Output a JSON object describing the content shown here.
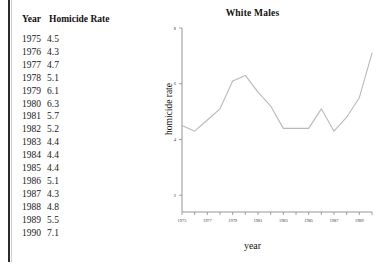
{
  "table": {
    "headers": [
      "Year",
      "Homicide Rate"
    ],
    "rows": [
      {
        "year": "1975",
        "rate": "4.5"
      },
      {
        "year": "1976",
        "rate": "4.3"
      },
      {
        "year": "1977",
        "rate": "4.7"
      },
      {
        "year": "1978",
        "rate": "5.1"
      },
      {
        "year": "1979",
        "rate": "6.1"
      },
      {
        "year": "1980",
        "rate": "6.3"
      },
      {
        "year": "1981",
        "rate": "5.7"
      },
      {
        "year": "1982",
        "rate": "5.2"
      },
      {
        "year": "1983",
        "rate": "4.4"
      },
      {
        "year": "1984",
        "rate": "4.4"
      },
      {
        "year": "1985",
        "rate": "4.4"
      },
      {
        "year": "1986",
        "rate": "5.1"
      },
      {
        "year": "1987",
        "rate": "4.3"
      },
      {
        "year": "1988",
        "rate": "4.8"
      },
      {
        "year": "1989",
        "rate": "5.5"
      },
      {
        "year": "1990",
        "rate": "7.1"
      }
    ]
  },
  "chart_data": {
    "type": "line",
    "title": "White Males",
    "xlabel": "year",
    "ylabel": "homicide rate",
    "x": [
      1975,
      1976,
      1977,
      1978,
      1979,
      1980,
      1981,
      1982,
      1983,
      1984,
      1985,
      1986,
      1987,
      1988,
      1989,
      1990
    ],
    "values": [
      4.5,
      4.3,
      4.7,
      5.1,
      6.1,
      6.3,
      5.7,
      5.2,
      4.4,
      4.4,
      4.4,
      5.1,
      4.3,
      4.8,
      5.5,
      7.1
    ],
    "series": [
      {
        "name": "White Males",
        "values": [
          4.5,
          4.3,
          4.7,
          5.1,
          6.1,
          6.3,
          5.7,
          5.2,
          4.4,
          4.4,
          4.4,
          5.1,
          4.3,
          4.8,
          5.5,
          7.1
        ]
      }
    ],
    "xlim": [
      1975,
      1990
    ],
    "ylim": [
      1.4,
      8.0
    ],
    "ytick_labels": [
      "8",
      "6",
      "4",
      "2"
    ],
    "yticks": [
      8,
      6,
      4,
      2
    ],
    "xtick_labels": [
      "1975",
      "1977",
      "1979",
      "1981",
      "1983",
      "1985",
      "1987",
      "1989"
    ],
    "xticks": [
      1975,
      1977,
      1979,
      1981,
      1983,
      1985,
      1987,
      1989
    ],
    "minor_xticks": [
      1976,
      1978,
      1980,
      1982,
      1984,
      1986,
      1988,
      1990
    ],
    "grid": false,
    "legend": "none",
    "line_color": "#b9b9b9",
    "axis_color": "#8a8a8a"
  }
}
